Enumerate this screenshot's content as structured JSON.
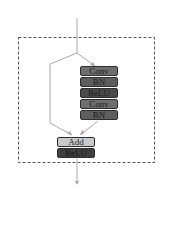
{
  "diagram": {
    "type": "residual-block",
    "main_path": [
      {
        "label": "Conv",
        "color": "#6e6e6e"
      },
      {
        "label": "BN",
        "color": "#5e5e5e"
      },
      {
        "label": "ReLU",
        "color": "#4a4a4a"
      },
      {
        "label": "Conv",
        "color": "#6e6e6e"
      },
      {
        "label": "BN",
        "color": "#5e5e5e"
      }
    ],
    "merge": [
      {
        "label": "Add",
        "color": "#c9c9c9"
      },
      {
        "label": "ReLU",
        "color": "#3e3e3e"
      }
    ],
    "colors": {
      "line": "#a8a8a8",
      "dashed_border": "#555555",
      "background": "#ffffff"
    }
  }
}
